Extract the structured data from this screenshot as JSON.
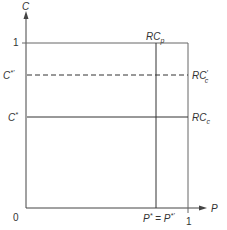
{
  "diagram": {
    "axes": {
      "y_label": "C",
      "x_label": "P",
      "origin_label": "0",
      "y_tick_one": "1",
      "x_tick_one": "1"
    },
    "y_levels": {
      "c_star_prime": {
        "label": "C*'",
        "base": "C",
        "sup": "*'"
      },
      "c_star": {
        "label": "C*",
        "base": "C",
        "sup": "*"
      }
    },
    "x_levels": {
      "p_star": {
        "label": "P* = P*'",
        "part1_base": "P",
        "part1_sup": "*",
        "eq": " = ",
        "part2_base": "P",
        "part2_sup": "*'"
      }
    },
    "curves": {
      "rc_p": {
        "label": "RCp",
        "base": "RC",
        "sub": "p",
        "style": "solid",
        "orientation": "vertical"
      },
      "rc_c_prime": {
        "label": "RC'c",
        "base": "RC",
        "sup": "′",
        "sub": "c",
        "style": "dashed",
        "orientation": "horizontal"
      },
      "rc_c": {
        "label": "RCc",
        "base": "RC",
        "sub": "c",
        "style": "solid",
        "orientation": "horizontal"
      }
    }
  }
}
